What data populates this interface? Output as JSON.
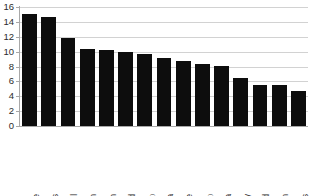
{
  "chart_data": {
    "type": "bar",
    "title": "",
    "subtitle": "",
    "xlabel": "",
    "ylabel": "",
    "ylim": [
      0,
      16
    ],
    "yticks": [
      0,
      2,
      4,
      6,
      8,
      10,
      12,
      14,
      16
    ],
    "ytick_labels": [
      "0",
      "2",
      "4",
      "6",
      "8",
      "10",
      "12",
      "14",
      "16"
    ],
    "grid": "horizontal",
    "legend": "none",
    "bar_color": "#0d0d0d",
    "gridline_color": "#d2d2d2",
    "axis_color": "#a8a8a8",
    "categories": [
      "Greece",
      "United States",
      "Portugal",
      "Belgium",
      "Spain",
      "New Zealand",
      "Italy (2004)",
      "Canada",
      "France",
      "Ireland (2003)",
      "Australia",
      "Germany",
      "Switzerland",
      "United Kingdom",
      "Netherlands"
    ],
    "category_names": [
      "Greece",
      "United States",
      "Portugal",
      "Belgium",
      "Spain",
      "New Zealand",
      "Italy",
      "Canada",
      "France",
      "Ireland",
      "Australia",
      "Germany",
      "Switzerland",
      "United Kingdom",
      "Netherlands"
    ],
    "category_years": [
      "",
      "",
      "",
      "",
      "",
      "",
      "(2004)",
      "",
      "",
      "(2003)",
      "",
      "",
      "",
      "",
      ""
    ],
    "values": [
      15.0,
      14.7,
      11.9,
      10.4,
      10.2,
      10.0,
      9.7,
      9.15,
      8.8,
      8.4,
      8.1,
      6.5,
      5.55,
      5.5,
      4.65
    ]
  }
}
